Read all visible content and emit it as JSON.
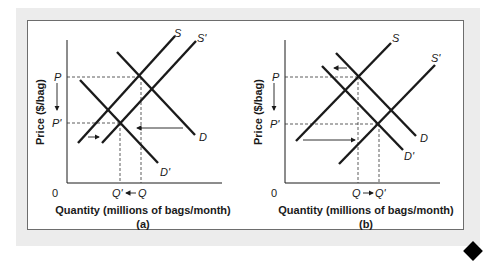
{
  "colors": {
    "line": "#1a1a1a",
    "background": "#ececec",
    "panel": "#ffffff",
    "frame": "#6d6d6d"
  },
  "panels": [
    {
      "id": "a",
      "caption": "(a)",
      "xlabel": "Quantity (millions of bags/month)",
      "ylabel": "Price ($/bag)",
      "origin": "0",
      "price_labels": {
        "initial": "P",
        "new": "P'"
      },
      "quantity_labels": {
        "initial": "Q",
        "new": "Q'",
        "arrow": "Q' ← Q"
      },
      "curves": {
        "supply": "S",
        "supply_new": "S'",
        "demand": "D",
        "demand_new": "D'"
      },
      "description": "Supply shifts right (S to S'), demand shifts left (D to D'); price falls P to P', quantity falls Q to Q'"
    },
    {
      "id": "b",
      "caption": "(b)",
      "xlabel": "Quantity (millions of bags/month)",
      "ylabel": "Price ($/bag)",
      "origin": "0",
      "price_labels": {
        "initial": "P",
        "new": "P'"
      },
      "quantity_labels": {
        "initial": "Q",
        "new": "Q'",
        "arrow": "Q → Q'"
      },
      "curves": {
        "supply": "S",
        "supply_new": "S'",
        "demand": "D",
        "demand_new": "D'"
      },
      "description": "Supply shifts far right (S to S'), demand shifts slightly left (D to D'); price falls P to P', quantity rises Q to Q'"
    }
  ]
}
